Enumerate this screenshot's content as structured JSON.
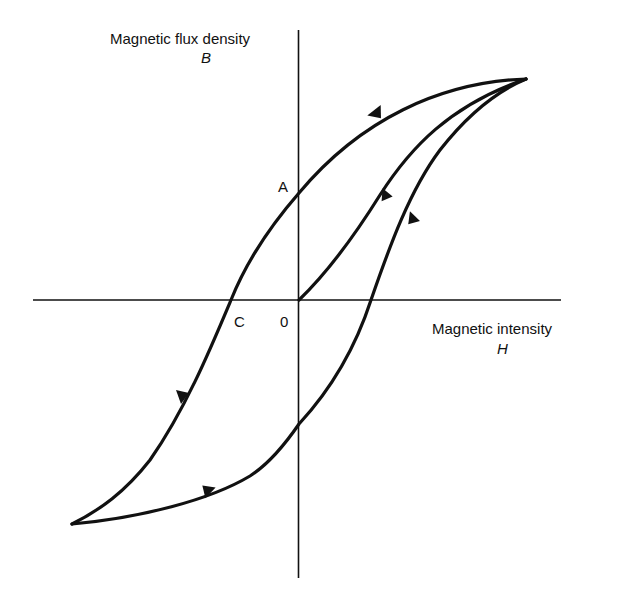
{
  "diagram": {
    "y_axis": {
      "label": "Magnetic flux density",
      "symbol": "B"
    },
    "x_axis": {
      "label": "Magnetic intensity",
      "symbol": "H"
    },
    "points": {
      "origin": "0",
      "remanence": "A",
      "coercivity": "C"
    },
    "colors": {
      "line": "#111111",
      "background": "#ffffff"
    }
  }
}
